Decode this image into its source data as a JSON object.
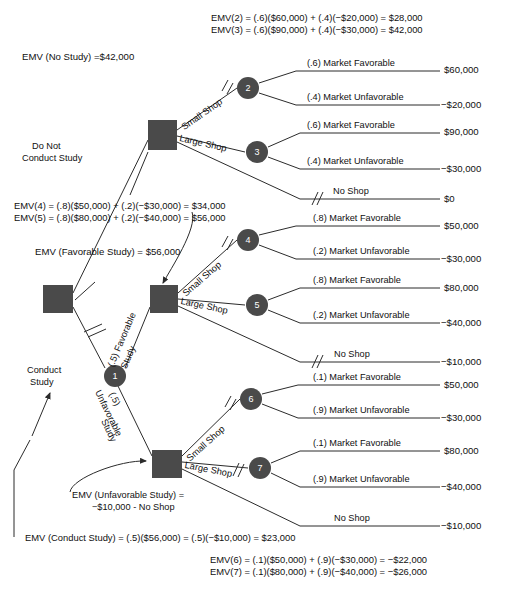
{
  "figure": {
    "type": "decision-tree"
  },
  "colors": {
    "node_fill": "#4a4a4a",
    "line": "#2b2b2b",
    "text": "#101010",
    "background": "#ffffff",
    "node_text": "#ffffff"
  },
  "annotations": {
    "emv_2_3": "EMV(2) = (.6)($60,000) + (.4)(−$20,000) = $28,000\nEMV(3) = (.6)($90,000) + (.4)(−$30,000) = $42,000",
    "emv_2": "EMV(2) = (.6)($60,000) + (.4)(−$20,000) = $28,000",
    "emv_3": "EMV(3) = (.6)($90,000) + (.4)(−$30,000) = $42,000",
    "emv_no_study": "EMV (No Study) =$42,000",
    "do_not_conduct_study": "Do Not\nConduct Study",
    "do_not_conduct_study_l1": "Do Not",
    "do_not_conduct_study_l2": "Conduct Study",
    "emv_4": "EMV(4) = (.8)($50,000) + (.2)(−$30,000) = $34,000",
    "emv_5": "EMV(5) = (.8)($80,000) + (.2)(−$40,000) = $56,000",
    "emv_favorable_study": "EMV (Favorable Study) = $56,000",
    "conduct_study": "Conduct\nStudy",
    "conduct_study_l1": "Conduct",
    "conduct_study_l2": "Study",
    "emv_unfavorable_study_l1": "EMV (Unfavorable Study) =",
    "emv_unfavorable_study_l2": "−$10,000 - No Shop",
    "emv_conduct_study": "EMV (Conduct Study) = (.5)($56,000) = (.5)(−$10,000) = $23,000",
    "emv_6": "EMV(6) = (.1)($50,000) + (.9)(−$30,000) = −$22,000",
    "emv_7": "EMV(7) = (.1)($80,000) + (.9)(−$40,000) = −$26,000"
  },
  "nodes": {
    "decision_root": {
      "label": "",
      "shape": "square"
    },
    "decision_no_study": {
      "label": "",
      "shape": "square"
    },
    "decision_favorable": {
      "label": "",
      "shape": "square"
    },
    "decision_unfavorable": {
      "label": "",
      "shape": "square"
    },
    "chance_1": {
      "label": "1",
      "shape": "circle"
    },
    "chance_2": {
      "label": "2",
      "shape": "circle"
    },
    "chance_3": {
      "label": "3",
      "shape": "circle"
    },
    "chance_4": {
      "label": "4",
      "shape": "circle"
    },
    "chance_5": {
      "label": "5",
      "shape": "circle"
    },
    "chance_6": {
      "label": "6",
      "shape": "circle"
    },
    "chance_7": {
      "label": "7",
      "shape": "circle"
    }
  },
  "branch_labels": {
    "small_shop_2": "Small Shop",
    "large_shop_3": "Large Shop",
    "small_shop_4": "Small Shop",
    "large_shop_5": "Large Shop",
    "small_shop_6": "Small Shop",
    "large_shop_7": "Large Shop",
    "favorable_study": "(.5) Favorable\nStudy",
    "favorable_study_prob": "(.5) Favorable",
    "favorable_study_word": "Study",
    "unfavorable_study_word": "Unfavorable",
    "unfavorable_study_prob": "(.5)",
    "unfavorable_study_word2": "Study"
  },
  "outcomes": [
    {
      "id": "o1",
      "label": "(.6) Market Favorable",
      "payoff": "$60,000"
    },
    {
      "id": "o2",
      "label": "(.4) Market Unfavorable",
      "payoff": "−$20,000"
    },
    {
      "id": "o3",
      "label": "(.6) Market Favorable",
      "payoff": "$90,000"
    },
    {
      "id": "o4",
      "label": "(.4) Market Unfavorable",
      "payoff": "−$30,000"
    },
    {
      "id": "o5",
      "label": "No Shop",
      "payoff": "$0"
    },
    {
      "id": "o6",
      "label": "(.8) Market Favorable",
      "payoff": "$50,000"
    },
    {
      "id": "o7",
      "label": "(.2) Market Unfavorable",
      "payoff": "−$30,000"
    },
    {
      "id": "o8",
      "label": "(.8) Market Favorable",
      "payoff": "$80,000"
    },
    {
      "id": "o9",
      "label": "(.2) Market Unfavorable",
      "payoff": "−$40,000"
    },
    {
      "id": "o10",
      "label": "No Shop",
      "payoff": "−$10,000"
    },
    {
      "id": "o11",
      "label": "(.1) Market Favorable",
      "payoff": "$50,000"
    },
    {
      "id": "o12",
      "label": "(.9) Market Unfavorable",
      "payoff": "−$30,000"
    },
    {
      "id": "o13",
      "label": "(.1) Market Favorable",
      "payoff": "$80,000"
    },
    {
      "id": "o14",
      "label": "(.9) Market Unfavorable",
      "payoff": "−$40,000"
    },
    {
      "id": "o15",
      "label": "No Shop",
      "payoff": "−$10,000"
    }
  ]
}
